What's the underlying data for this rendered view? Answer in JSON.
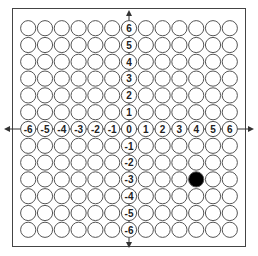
{
  "grid": {
    "x_min": -6,
    "x_max": 6,
    "y_min": -6,
    "y_max": 6,
    "x_labels": [
      "-6",
      "-5",
      "-4",
      "-3",
      "-2",
      "-1",
      "0",
      "1",
      "2",
      "3",
      "4",
      "5",
      "6"
    ],
    "y_labels": [
      "6",
      "5",
      "4",
      "3",
      "2",
      "1",
      "-1",
      "-2",
      "-3",
      "-4",
      "-5",
      "-6"
    ]
  },
  "filled_points": [
    {
      "x": 4,
      "y": -3
    }
  ],
  "colors": {
    "circle_stroke": "#555555",
    "fill": "#000000",
    "axis": "#333333"
  }
}
